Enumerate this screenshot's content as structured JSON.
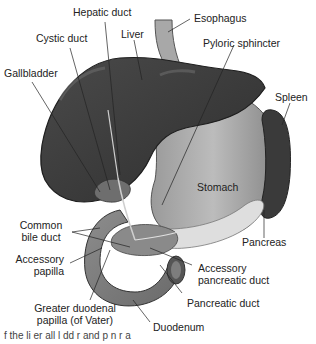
{
  "figure": {
    "colors": {
      "organ_dark": "#3a3a3a",
      "organ_mid": "#7a7a7a",
      "organ_light": "#bdbdbd",
      "pancreas": "#dcdcdc",
      "line": "#222222",
      "background": "#ffffff"
    },
    "labels": {
      "hepatic_duct": "Hepatic duct",
      "esophagus": "Esophagus",
      "cystic_duct": "Cystic duct",
      "liver": "Liver",
      "pyloric_sphincter": "Pyloric sphincter",
      "gallbladder": "Gallbladder",
      "spleen": "Spleen",
      "stomach": "Stomach",
      "pancreas": "Pancreas",
      "common_bile_duct_1": "Common",
      "common_bile_duct_2": "bile duct",
      "accessory_papilla_1": "Accessory",
      "accessory_papilla_2": "papilla",
      "accessory_pancreatic_duct_1": "Accessory",
      "accessory_pancreatic_duct_2": "pancreatic duct",
      "pancreatic_duct": "Pancreatic duct",
      "greater_duodenal_papilla_1": "Greater duodenal",
      "greater_duodenal_papilla_2": "papilla (of Vater)",
      "duodenum": "Duodenum"
    },
    "caption_fragment": "f  the  li  er   all  l  dd  r  and  p  n  r  a"
  }
}
